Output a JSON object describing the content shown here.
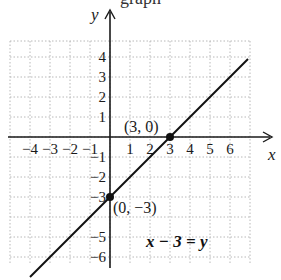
{
  "page": {
    "clipped_heading": "graph"
  },
  "chart_data": {
    "type": "line",
    "title": "",
    "equation_label": "x − 3 = y",
    "xlabel": "x",
    "ylabel": "y",
    "xlim": [
      -5,
      7
    ],
    "ylim": [
      -6.4,
      4.8
    ],
    "grid": true,
    "grid_style": "dotted",
    "x_tick_labels": [
      "−4",
      "−3",
      "−2",
      "−1",
      "1",
      "2",
      "3",
      "4",
      "5",
      "6"
    ],
    "x_ticks": [
      -4,
      -3,
      -2,
      -1,
      1,
      2,
      3,
      4,
      5,
      6
    ],
    "y_tick_labels": [
      "4",
      "3",
      "2",
      "1",
      "−1",
      "−2",
      "−3",
      "−5",
      "−6"
    ],
    "y_ticks": [
      4,
      3,
      2,
      1,
      -1,
      -2,
      -3,
      -5,
      -6
    ],
    "series": [
      {
        "name": "x − 3 = y",
        "slope": 1,
        "intercept": -3,
        "x": [
          -4,
          6.9
        ],
        "y": [
          -7,
          3.9
        ]
      }
    ],
    "points": [
      {
        "x": 3,
        "y": 0,
        "label": "(3, 0)"
      },
      {
        "x": 0,
        "y": -3,
        "label": "(0, −3)"
      }
    ],
    "colors": {
      "line": "#111111",
      "grid": "#b8b8b8",
      "axis": "#1a1a1a"
    }
  }
}
